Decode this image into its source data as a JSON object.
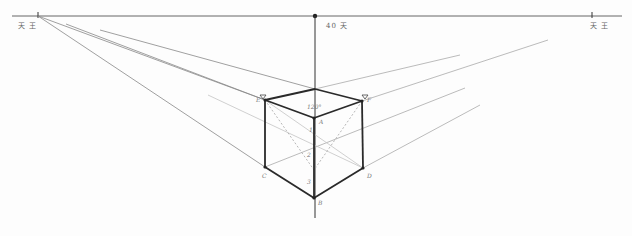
{
  "diagram": {
    "horizon": {
      "y": 16,
      "x1": 12,
      "x2": 622
    },
    "vanishing_points": {
      "left": {
        "x": 38,
        "y": 16,
        "label": "天 王"
      },
      "right": {
        "x": 592,
        "y": 16,
        "label": "天 王"
      },
      "center": {
        "x": 315,
        "y": 16,
        "label": "40 天"
      }
    },
    "cube": {
      "vertices": {
        "top_back": [
          315,
          89
        ],
        "E": [
          265,
          100
        ],
        "F": [
          362,
          101
        ],
        "A": [
          314,
          118
        ],
        "C": [
          265,
          167
        ],
        "D": [
          363,
          168
        ],
        "B": [
          314,
          198
        ]
      },
      "labels": {
        "E": "E",
        "F": "F",
        "A": "A",
        "C": "C",
        "D": "D",
        "B": "B"
      },
      "angle_label": "120°",
      "division_marks": [
        "1",
        "2",
        "3"
      ]
    },
    "colors": {
      "ink": "#2a2a2a",
      "guide": "#9a9a9a",
      "faint": "#c8c8c8"
    }
  }
}
